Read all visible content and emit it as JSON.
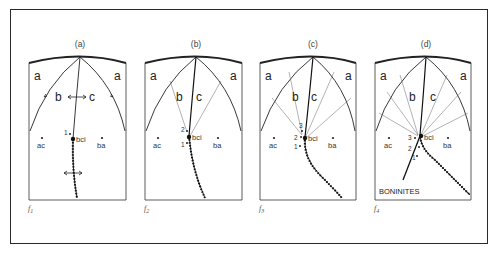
{
  "figure": {
    "panels": [
      {
        "id": "a",
        "caption": "(a)",
        "field_label": "f",
        "field_sub": "1",
        "region_left": "a",
        "region_right": "a",
        "region_b": "b",
        "region_c": "c",
        "point_ac": "ac",
        "point_ba": "ba",
        "point_bci": "bci",
        "numbers": [
          "1"
        ]
      },
      {
        "id": "b",
        "caption": "(b)",
        "field_label": "f",
        "field_sub": "2",
        "region_left": "a",
        "region_right": "a",
        "region_b": "b",
        "region_c": "c",
        "point_ac": "ac",
        "point_ba": "ba",
        "point_bci": "bci",
        "numbers": [
          "1",
          "2"
        ]
      },
      {
        "id": "c",
        "caption": "(c)",
        "field_label": "f",
        "field_sub": "3",
        "region_left": "a",
        "region_right": "a",
        "region_b": "b",
        "region_c": "c",
        "point_ac": "ac",
        "point_ba": "ba",
        "point_bci": "bci",
        "numbers": [
          "1",
          "2",
          "3"
        ]
      },
      {
        "id": "d",
        "caption": "(d)",
        "field_label": "f",
        "field_sub": "4",
        "region_left": "a",
        "region_right": "a",
        "region_b": "b",
        "region_c": "c",
        "point_ac": "ac",
        "point_ba": "ba",
        "point_bci": "bci",
        "numbers": [
          "1",
          "2",
          "3"
        ],
        "annotation": "BONINITES"
      }
    ],
    "colors": {
      "line": "#2a2a2a",
      "thin": "#555555",
      "background": "#ffffff"
    }
  }
}
